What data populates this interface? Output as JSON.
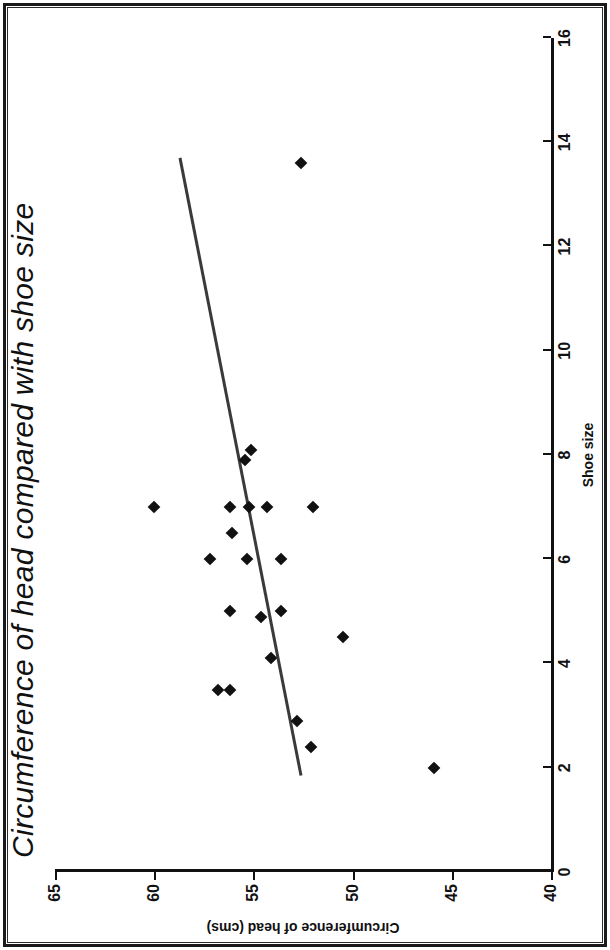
{
  "chart_data": {
    "type": "scatter",
    "title": "Circumference of head compared with shoe size",
    "xlabel": "Shoe size",
    "ylabel": "Circumference of head (cms)",
    "xlim": [
      0,
      16
    ],
    "ylim": [
      40,
      65
    ],
    "xticks": [
      0,
      2,
      4,
      6,
      8,
      10,
      12,
      14,
      16
    ],
    "yticks": [
      40,
      45,
      50,
      55,
      60,
      65
    ],
    "xtick_labels": [
      "0",
      "2",
      "4",
      "6",
      "8",
      "10",
      "12",
      "14",
      "16"
    ],
    "ytick_labels": [
      "40",
      "45",
      "50",
      "55",
      "60",
      "65"
    ],
    "grid": false,
    "legend": null,
    "orientation": "rotated-90-ccw",
    "points": [
      {
        "x": 2.0,
        "y": 45.9
      },
      {
        "x": 2.4,
        "y": 52.1
      },
      {
        "x": 2.9,
        "y": 52.8
      },
      {
        "x": 3.5,
        "y": 56.2
      },
      {
        "x": 3.5,
        "y": 56.8
      },
      {
        "x": 4.1,
        "y": 54.1
      },
      {
        "x": 4.5,
        "y": 50.5
      },
      {
        "x": 4.9,
        "y": 54.6
      },
      {
        "x": 5.0,
        "y": 56.2
      },
      {
        "x": 5.0,
        "y": 53.6
      },
      {
        "x": 6.0,
        "y": 57.2
      },
      {
        "x": 6.0,
        "y": 55.3
      },
      {
        "x": 6.0,
        "y": 53.6
      },
      {
        "x": 6.5,
        "y": 56.1
      },
      {
        "x": 7.0,
        "y": 60.0
      },
      {
        "x": 7.0,
        "y": 56.2
      },
      {
        "x": 7.0,
        "y": 55.2
      },
      {
        "x": 7.0,
        "y": 54.3
      },
      {
        "x": 7.0,
        "y": 52.0
      },
      {
        "x": 7.9,
        "y": 55.4
      },
      {
        "x": 8.1,
        "y": 55.1
      },
      {
        "x": 13.6,
        "y": 52.6
      }
    ],
    "trendline": {
      "type": "linear-fit",
      "x_start": 1.85,
      "y_start": 52.6,
      "x_end": 13.7,
      "y_end": 58.7,
      "color": "#3a3a3a"
    },
    "marker": {
      "shape": "diamond",
      "color": "#111111",
      "size_px": 9
    },
    "axis_color": "#111111",
    "background": "#ffffff"
  }
}
